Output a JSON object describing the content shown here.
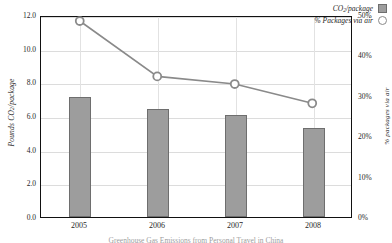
{
  "chart_data": {
    "type": "bar",
    "title": "",
    "subtitle": "",
    "categories": [
      "2005",
      "2006",
      "2007",
      "2008"
    ],
    "xlabel": "",
    "series": [
      {
        "name": "CO2/package",
        "legend_label": "CO₂/package",
        "type": "bar",
        "axis": "left",
        "values": [
          7.1,
          6.4,
          6.05,
          5.3
        ],
        "color": "#9d9d9d",
        "edge_color": "#6e6e6e"
      },
      {
        "name": "% Packages via air",
        "legend_label": "% Packages via air",
        "type": "line",
        "axis": "right",
        "values": [
          49.0,
          35.2,
          33.3,
          28.5
        ],
        "color": "#8a8a8a",
        "marker": "open-circle"
      }
    ],
    "left_axis": {
      "label": "Pounds CO₂/package",
      "ticks": [
        "0.0",
        "2.0",
        "4.0",
        "6.0",
        "8.0",
        "10.0",
        "12.0"
      ],
      "tick_values": [
        0,
        2,
        4,
        6,
        8,
        10,
        12
      ],
      "ylim": [
        0,
        12
      ]
    },
    "right_axis": {
      "label": "% packages via air",
      "ticks": [
        "0%",
        "10%",
        "20%",
        "30%",
        "40%",
        "50%"
      ],
      "tick_values": [
        0,
        10,
        20,
        30,
        40,
        50
      ],
      "ylim": [
        0,
        50
      ]
    },
    "grid": true,
    "legend_position": "top-right"
  },
  "legend": {
    "entries": [
      {
        "label_main": "CO",
        "label_sub": "2",
        "label_tail": "/package",
        "swatch": "bar-swatch"
      },
      {
        "label": "% Packages via air",
        "swatch": "circle-marker"
      }
    ]
  },
  "caption": {
    "text": "Greenhouse Gas Emissions from Personal Travel in China"
  }
}
